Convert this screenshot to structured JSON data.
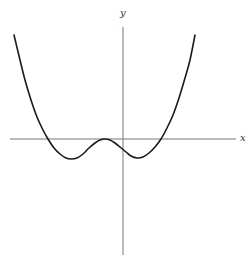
{
  "chart_data": {
    "type": "line",
    "title": "",
    "xlabel": "x",
    "ylabel": "y",
    "grid": false,
    "legend": null,
    "axis_origin_px": {
      "x": 123,
      "y": 139
    },
    "x_axis_px": {
      "x1": 10,
      "x2": 236,
      "y": 139
    },
    "y_axis_px": {
      "x": 123,
      "y1": 27,
      "y2": 255
    },
    "series": [
      {
        "name": "curve",
        "points_px": [
          [
            14,
            35
          ],
          [
            20,
            60
          ],
          [
            25,
            80
          ],
          [
            31,
            100
          ],
          [
            37,
            117
          ],
          [
            43,
            130
          ],
          [
            48,
            139
          ],
          [
            54,
            148
          ],
          [
            60,
            154
          ],
          [
            66,
            158
          ],
          [
            71,
            159
          ],
          [
            77,
            158
          ],
          [
            83,
            154
          ],
          [
            89,
            148
          ],
          [
            95,
            143
          ],
          [
            100,
            140
          ],
          [
            105,
            139
          ],
          [
            110,
            140
          ],
          [
            115,
            143
          ],
          [
            120,
            147
          ],
          [
            126,
            152
          ],
          [
            131,
            156
          ],
          [
            137,
            158
          ],
          [
            143,
            157
          ],
          [
            149,
            153
          ],
          [
            155,
            147
          ],
          [
            161,
            139
          ],
          [
            167,
            128
          ],
          [
            173,
            115
          ],
          [
            179,
            98
          ],
          [
            185,
            78
          ],
          [
            190,
            60
          ],
          [
            195,
            35
          ]
        ]
      }
    ],
    "features": {
      "x_intercepts_px": [
        48,
        105,
        161
      ],
      "local_minima_px": [
        [
          71,
          159
        ],
        [
          137,
          158
        ]
      ],
      "local_maximum_px": [
        105,
        139
      ]
    }
  },
  "labels": {
    "x": "x",
    "y": "y"
  },
  "colors": {
    "curve": "#1a1a1a",
    "axes": "#777777",
    "background": "#ffffff"
  }
}
